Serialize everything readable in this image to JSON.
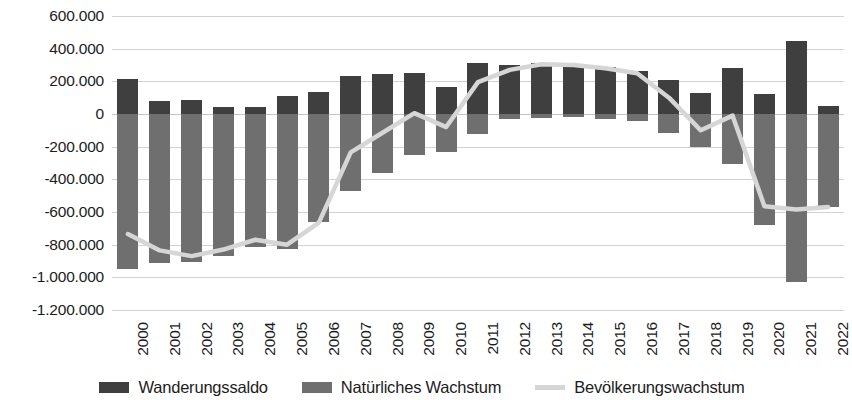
{
  "chart_data": {
    "type": "bar",
    "title": "",
    "subtitle": "",
    "xlabel": "",
    "ylabel": "",
    "grid": true,
    "legend_position": "bottom",
    "ylim": [
      -1200000,
      600000
    ],
    "ytick_step": 200000,
    "ytick_labels": [
      "600.000",
      "400.000",
      "200.000",
      "0",
      "-200.000",
      "-400.000",
      "-600.000",
      "-800.000",
      "-1.000.000",
      "-1.200.000"
    ],
    "ytick_values": [
      600000,
      400000,
      200000,
      0,
      -200000,
      -400000,
      -600000,
      -800000,
      -1000000,
      -1200000
    ],
    "categories": [
      "2000",
      "2001",
      "2002",
      "2003",
      "2004",
      "2005",
      "2006",
      "2007",
      "2008",
      "2009",
      "2010",
      "2011",
      "2012",
      "2013",
      "2014",
      "2015",
      "2016",
      "2017",
      "2018",
      "2019",
      "2020",
      "2021",
      "2022"
    ],
    "series": [
      {
        "name": "Wanderungssaldo",
        "kind": "bar",
        "color": "#3f3f3f",
        "values": [
          215000,
          80000,
          85000,
          40000,
          45000,
          110000,
          135000,
          235000,
          245000,
          250000,
          165000,
          315000,
          300000,
          310000,
          300000,
          290000,
          265000,
          210000,
          130000,
          280000,
          120000,
          450000,
          50000
        ]
      },
      {
        "name": "Natürliches Wachstum",
        "kind": "bar",
        "color": "#6f6f6f",
        "values": [
          -950000,
          -915000,
          -905000,
          -870000,
          -815000,
          -825000,
          -660000,
          -470000,
          -360000,
          -250000,
          -235000,
          -125000,
          -30000,
          -25000,
          -20000,
          -30000,
          -40000,
          -115000,
          -200000,
          -305000,
          -680000,
          -1030000,
          -570000
        ]
      },
      {
        "name": "Bevölkerungswachstum",
        "kind": "line",
        "color": "#d6d6d6",
        "values": [
          -735000,
          -835000,
          -870000,
          -830000,
          -770000,
          -800000,
          -665000,
          -235000,
          -115000,
          5000,
          -80000,
          195000,
          270000,
          305000,
          300000,
          280000,
          250000,
          100000,
          -100000,
          -10000,
          -565000,
          -585000,
          -570000
        ]
      }
    ]
  },
  "legend": {
    "items": [
      {
        "label": "Wanderungssaldo",
        "swatch": "dark-square",
        "color": "#3f3f3f"
      },
      {
        "label": "Natürliches Wachstum",
        "swatch": "gray-square",
        "color": "#6f6f6f"
      },
      {
        "label": "Bevölkerungswachstum",
        "swatch": "light-line",
        "color": "#d6d6d6"
      }
    ]
  }
}
